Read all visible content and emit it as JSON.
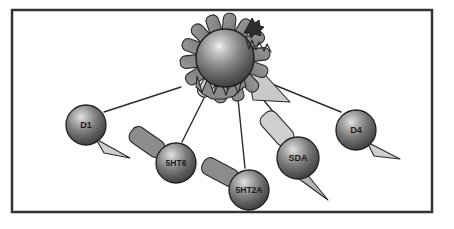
{
  "figure": {
    "canvas": {
      "width": 454,
      "height": 229
    },
    "background_color": "#ffffff",
    "frame": {
      "name": "diagram-border",
      "x": 12,
      "y": 10,
      "width": 420,
      "height": 202,
      "stroke_color": "#333333",
      "stroke_width": 2.5,
      "fill_color": "#ffffff"
    },
    "colors": {
      "sphere_dark": "#4a4a4a",
      "sphere_mid": "#6e6e6e",
      "sphere_highlight": "#d8d8d8",
      "sphere_outline": "#1f1f1f",
      "petal_gray": "#8a8a8a",
      "petal_light": "#c9c9c9",
      "appendage_light": "#cfcfcf",
      "appendage_mid": "#8c8c8c",
      "connector_line": "#2b2b2b",
      "label_text": "#1b1b1b"
    }
  },
  "central_receptor": {
    "name": "central-receptor",
    "cx": 225,
    "cy": 58,
    "radius": 29,
    "petal_count": 14,
    "petal_light_index": 12,
    "has_sawtooth": true,
    "has_activation_triangle": true,
    "has_ligand_icon": true,
    "ligand_icon_name": "bound-ligand-icon",
    "activation_triangle": {
      "name": "receptor-activation-triangle",
      "points": "244,52 290,102 253,100"
    },
    "sawtooth": {
      "name": "receptor-sawtooth",
      "points": "197,76 202,92 208,78 214,94 220,79 226,95 232,79 238,93 243,77 246,86 240,90 234,96 224,99 212,99 203,94 196,87"
    }
  },
  "nodes": [
    {
      "id": "d1",
      "name": "receptor-node-d1",
      "label": "D1",
      "cx": 86,
      "cy": 125,
      "radius": 20,
      "font_size": 9,
      "appendages": [
        {
          "type": "triangle",
          "name": "d1-antagonist-tail",
          "points": "96,139 130,158 104,153",
          "fill": "#cfcfcf"
        }
      ]
    },
    {
      "id": "5ht6",
      "name": "receptor-node-5ht6",
      "label": "5HT6",
      "cx": 176,
      "cy": 163,
      "radius": 20,
      "font_size": 8.5,
      "appendages": [
        {
          "type": "rect",
          "name": "5ht6-ligand-tail",
          "x": 128,
          "y": 133,
          "width": 38,
          "height": 18,
          "rx": 7,
          "rotate": 35,
          "fill": "#8c8c8c"
        }
      ]
    },
    {
      "id": "5ht2a",
      "name": "receptor-node-5ht2a",
      "label": "5HT2A",
      "cx": 249,
      "cy": 190,
      "radius": 20,
      "font_size": 8.5,
      "appendages": [
        {
          "type": "rect",
          "name": "5ht2a-ligand-tail",
          "x": 201,
          "y": 163,
          "width": 38,
          "height": 18,
          "rx": 7,
          "rotate": 28,
          "fill": "#8c8c8c"
        }
      ]
    },
    {
      "id": "sda",
      "name": "receptor-node-sda",
      "label": "SDA",
      "cx": 298,
      "cy": 158,
      "radius": 21,
      "font_size": 9,
      "appendages": [
        {
          "type": "rect",
          "name": "sda-ligand-tail",
          "x": 258,
          "y": 119,
          "width": 38,
          "height": 19,
          "rx": 7,
          "rotate": 48,
          "fill": "#cfcfcf"
        },
        {
          "type": "triangle",
          "name": "sda-agonist-tail",
          "points": "306,173 328,200 295,176",
          "fill": "#b5b5b5"
        }
      ]
    },
    {
      "id": "d4",
      "name": "receptor-node-d4",
      "label": "D4",
      "cx": 356,
      "cy": 130,
      "radius": 20,
      "font_size": 9,
      "appendages": [
        {
          "type": "triangle",
          "name": "d4-antagonist-tail",
          "points": "367,142 400,159 374,156",
          "fill": "#cfcfcf"
        }
      ]
    }
  ],
  "connectors": [
    {
      "name": "connector-center-to-d1",
      "x1": 181,
      "y1": 87,
      "x2": 104,
      "y2": 112
    },
    {
      "name": "connector-center-to-5ht6",
      "x1": 205,
      "y1": 96,
      "x2": 182,
      "y2": 142
    },
    {
      "name": "connector-center-to-5ht2a",
      "x1": 238,
      "y1": 99,
      "x2": 245,
      "y2": 168
    },
    {
      "name": "connector-center-to-sda",
      "x1": 256,
      "y1": 91,
      "x2": 290,
      "y2": 132
    },
    {
      "name": "connector-center-to-d4",
      "x1": 272,
      "y1": 84,
      "x2": 341,
      "y2": 112
    }
  ]
}
